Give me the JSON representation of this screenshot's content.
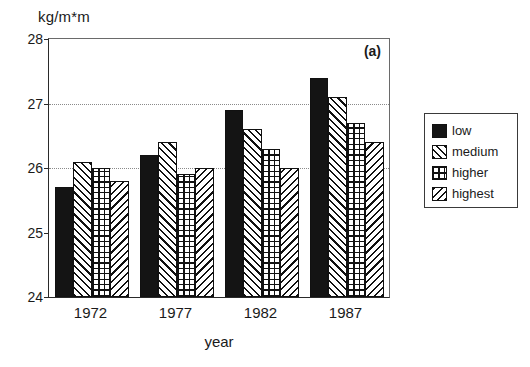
{
  "chart_data": {
    "type": "bar",
    "title": "",
    "annotation": "(a)",
    "xlabel": "year",
    "ylabel": "kg/m*m",
    "categories": [
      "1972",
      "1977",
      "1982",
      "1987"
    ],
    "series": [
      {
        "name": "low",
        "pattern": "solid",
        "values": [
          25.7,
          26.2,
          26.9,
          27.4
        ]
      },
      {
        "name": "medium",
        "pattern": "diag-fwd",
        "values": [
          26.1,
          26.4,
          26.6,
          27.1
        ]
      },
      {
        "name": "higher",
        "pattern": "grid",
        "values": [
          26.0,
          25.9,
          26.3,
          26.7
        ]
      },
      {
        "name": "highest",
        "pattern": "diag-back",
        "values": [
          25.8,
          26.0,
          26.0,
          26.4
        ]
      }
    ],
    "ylim": [
      24,
      28
    ],
    "yticks": [
      24,
      25,
      26,
      27,
      28
    ],
    "ytick_labels": [
      "24",
      "25",
      "26",
      "27",
      "28"
    ],
    "gridlines_y": [
      26,
      27
    ],
    "grid": true,
    "legend_position": "right-outside",
    "legend_entries": [
      "low",
      "medium",
      "higher",
      "highest"
    ],
    "colors": {
      "foreground": "#111111",
      "background": "#ffffff",
      "axis": "#2a2a2a",
      "grid": "#8a8a8a"
    }
  }
}
